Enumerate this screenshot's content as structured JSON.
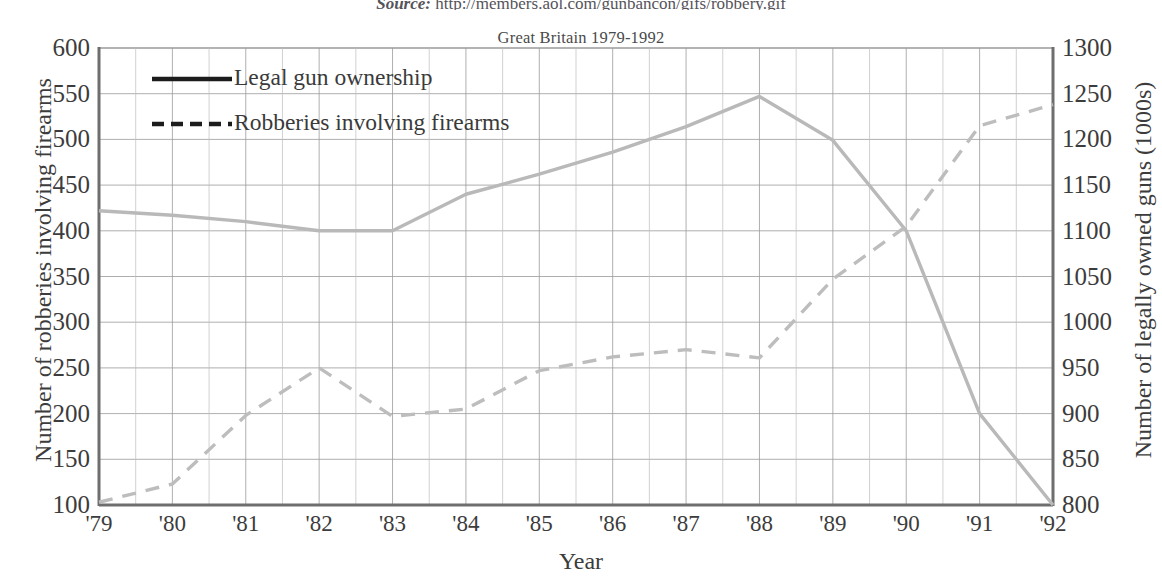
{
  "source": {
    "label": "Source:",
    "url": "http://members.aol.com/gunbancon/gifs/robbery.gif"
  },
  "chart_data": {
    "type": "line",
    "title": "Great Britain 1979-1992",
    "xlabel": "Year",
    "ylabel": "Number of robberies involving firearms",
    "ylabel_right": "Number of legally owned guns (1000s)",
    "categories": [
      "'79",
      "'80",
      "'81",
      "'82",
      "'83",
      "'84",
      "'85",
      "'86",
      "'87",
      "'88",
      "'89",
      "'90",
      "'91",
      "'92"
    ],
    "x_values": [
      1979,
      1980,
      1981,
      1982,
      1983,
      1984,
      1985,
      1986,
      1987,
      1988,
      1989,
      1990,
      1991,
      1992
    ],
    "ylim": [
      100,
      600
    ],
    "yticks": [
      100,
      150,
      200,
      250,
      300,
      350,
      400,
      450,
      500,
      550,
      600
    ],
    "ylim_right": [
      800,
      1300
    ],
    "yticks_right": [
      800,
      850,
      900,
      950,
      1000,
      1050,
      1100,
      1150,
      1200,
      1250,
      1300
    ],
    "grid": true,
    "legend_position": "top-left",
    "series": [
      {
        "name": "Legal gun ownership",
        "axis": "right",
        "style": "solid",
        "color": "#b9b9b9",
        "values": [
          1122,
          1117,
          1110,
          1100,
          1100,
          1140,
          1162,
          1186,
          1214,
          1247,
          1199,
          1100,
          900,
          800
        ],
        "values_left_scale": [
          422,
          417,
          410,
          400,
          400,
          440,
          462,
          486,
          514,
          547,
          499,
          400,
          200,
          100
        ]
      },
      {
        "name": "Robberies involving firearms",
        "axis": "left",
        "style": "dashed",
        "color": "#bdbdbd",
        "values": [
          103,
          123,
          198,
          250,
          197,
          205,
          247,
          262,
          270,
          261,
          347,
          405,
          515,
          538
        ]
      }
    ]
  },
  "legend": {
    "items": [
      {
        "label": "Legal gun ownership",
        "style": "solid"
      },
      {
        "label": "Robberies involving firearms",
        "style": "dashed"
      }
    ]
  }
}
